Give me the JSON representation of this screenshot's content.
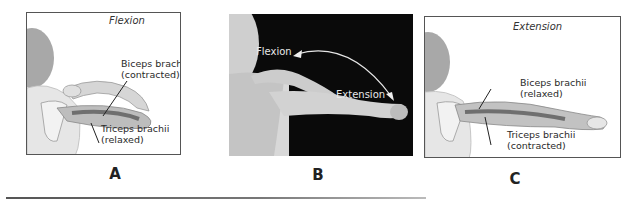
{
  "figure": {
    "panels": [
      {
        "letter": "A",
        "title": "Flexion",
        "labels": {
          "top_line1": "Biceps brachii",
          "top_line2": "(contracted)",
          "bottom_line1": "Triceps brachii",
          "bottom_line2": "(relaxed)"
        }
      },
      {
        "letter": "B",
        "labels": {
          "arrow_start": "Flexion",
          "arrow_end": "Extension"
        }
      },
      {
        "letter": "C",
        "title": "Extension",
        "labels": {
          "top_line1": "Biceps brachii",
          "top_line2": "(relaxed)",
          "bottom_line1": "Triceps brachii",
          "bottom_line2": "(contracted)"
        }
      }
    ]
  },
  "colors": {
    "frame_border": "#555555",
    "photo_bg": "#0a0a0a",
    "skin_illustration": "#d9d9d9",
    "muscle": "#8a8a8a",
    "text": "#2a2a2a"
  }
}
